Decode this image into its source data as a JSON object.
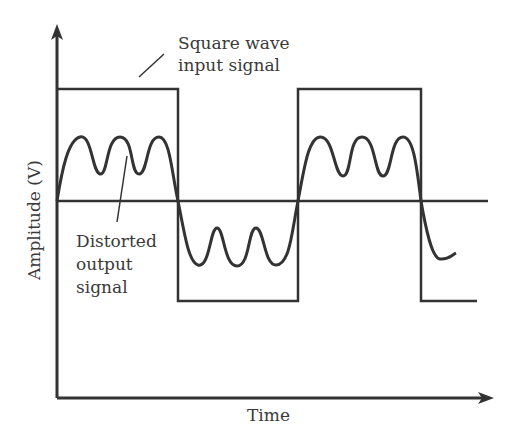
{
  "diagram": {
    "labels": {
      "input_line1": "Square wave",
      "input_line2": "input signal",
      "output_line1": "Distorted",
      "output_line2": "output",
      "output_line3": "signal",
      "y_axis": "Amplitude (V)",
      "x_axis": "Time"
    },
    "colors": {
      "stroke": "#333333",
      "background": "#ffffff"
    }
  }
}
